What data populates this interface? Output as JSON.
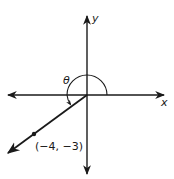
{
  "diagram": {
    "type": "coordinate-plane-angle",
    "axes": {
      "x_label": "x",
      "y_label": "y"
    },
    "angle": {
      "label": "θ",
      "description": "Angle in standard position measured counterclockwise from positive x-axis to terminal ray"
    },
    "terminal_point": {
      "label": "(−4, −3)",
      "x": -4,
      "y": -3
    },
    "colors": {
      "ink": "#1a1a1a",
      "background": "#ffffff"
    }
  }
}
